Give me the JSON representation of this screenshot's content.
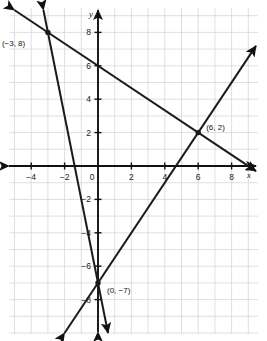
{
  "chart_data": {
    "type": "line",
    "title": "",
    "xlabel": "x",
    "ylabel": "y",
    "xlim": [
      -5.3,
      9.6
    ],
    "ylim": [
      -9.5,
      9.4
    ],
    "grid": true,
    "grid_step": 1,
    "legend": "none",
    "x_ticks": [
      -4,
      -2,
      2,
      4,
      6,
      8
    ],
    "y_ticks": [
      8,
      6,
      4,
      2,
      -2,
      -4,
      -6,
      -8
    ],
    "x_tick_labels": [
      "-4",
      "-2",
      "2",
      "4",
      "6",
      "8"
    ],
    "y_tick_labels": [
      "8",
      "6",
      "4",
      "2",
      "-2",
      "-4",
      "-6",
      "-8"
    ],
    "origin_label": "0",
    "series": [
      {
        "name": "line-shallow-negative",
        "equation": "y = -2/3 x + 6",
        "slope": -0.6667,
        "intercept": 6,
        "points": [
          [
            -3,
            8
          ],
          [
            6,
            2
          ]
        ],
        "arrows": "both"
      },
      {
        "name": "line-steep-negative",
        "equation": "y = -5x - 7",
        "slope": -5,
        "intercept": -7,
        "points": [
          [
            -3,
            8
          ],
          [
            0,
            -7
          ]
        ],
        "arrows": "both"
      },
      {
        "name": "line-rising",
        "equation": "y = 3/2 x - 7",
        "slope": 1.5,
        "intercept": -7,
        "points": [
          [
            0,
            -7
          ],
          [
            6,
            2
          ]
        ],
        "arrows": "both"
      }
    ],
    "annotations": [
      {
        "name": "point-neg3-8",
        "label": "(−3, 8)",
        "x": -3,
        "y": 8,
        "label_dx": -46,
        "label_dy": 14
      },
      {
        "name": "point-6-2",
        "label": "(6, 2)",
        "x": 6,
        "y": 2,
        "label_dx": 8,
        "label_dy": -3
      },
      {
        "name": "point-0-neg7",
        "label": "(0, −7)",
        "x": 0,
        "y": -7,
        "label_dx": 9,
        "label_dy": 10
      }
    ]
  },
  "axes": {
    "x_axis_name": "x",
    "y_axis_name": "y"
  },
  "colors": {
    "grid": "#d4d7da",
    "axis": "#111111",
    "line": "#1a1a1a",
    "background": "#ffffff",
    "text": "#1a1a1a"
  }
}
